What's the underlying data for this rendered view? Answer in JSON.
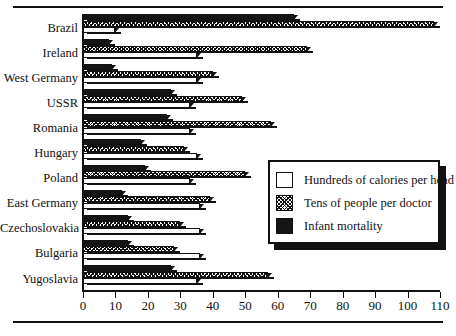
{
  "chart_data": {
    "type": "bar",
    "orientation": "horizontal",
    "title": "",
    "xlabel": "",
    "ylabel": "",
    "xlim": [
      0,
      110
    ],
    "xticks": [
      0,
      10,
      20,
      30,
      40,
      50,
      60,
      70,
      80,
      90,
      100,
      110
    ],
    "xticklabels": [
      "0",
      "10",
      "20",
      "30",
      "40",
      "50",
      "60",
      "70",
      "80",
      "90",
      "100",
      "110"
    ],
    "grid": false,
    "legend_position": "center-right",
    "categories": [
      "Brazil",
      "Ireland",
      "West Germany",
      "USSR",
      "Romania",
      "Hungary",
      "Poland",
      "East Germany",
      "Czechoslovakia",
      "Bulgaria",
      "Yugoslavia"
    ],
    "series": [
      {
        "name": "Infant mortality",
        "pattern": "solid-black",
        "color": "#151515",
        "values": [
          65,
          8,
          9,
          27,
          26,
          18,
          19,
          12,
          14,
          14,
          27
        ]
      },
      {
        "name": "Tens of people per doctor",
        "pattern": "dense-checker",
        "color": "#ffffff",
        "values": [
          108,
          69,
          40,
          49,
          58,
          31,
          50,
          39,
          30,
          28,
          57
        ]
      },
      {
        "name": "Hundreds of calories per head",
        "pattern": "sparse-dots",
        "color": "#ffffff",
        "values": [
          10,
          35,
          35,
          33,
          33,
          35,
          33,
          36,
          36,
          36,
          35
        ]
      }
    ]
  },
  "legend": {
    "items": [
      {
        "label": "Hundreds of calories per head",
        "swatch": "sparse-dots"
      },
      {
        "label": "Tens of people per doctor",
        "swatch": "dense-checker"
      },
      {
        "label": "Infant mortality",
        "swatch": "solid-black"
      }
    ]
  }
}
